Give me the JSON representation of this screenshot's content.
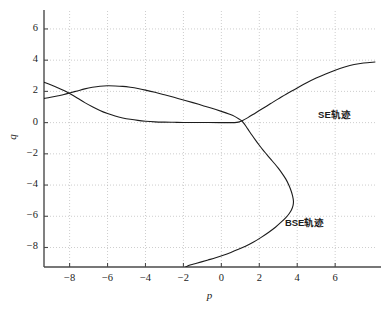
{
  "chart_data": {
    "type": "line",
    "title": "",
    "xlabel": "p",
    "ylabel": "q",
    "xlim": [
      -9.35,
      8.1
    ],
    "ylim": [
      -9.25,
      7.15
    ],
    "grid": true,
    "grid_style": "dotted",
    "legend_position": "inline-annotations",
    "xticks": [
      -8,
      -6,
      -4,
      -2,
      0,
      2,
      4,
      6
    ],
    "xtick_labels": [
      "−8",
      "−6",
      "−4",
      "−2",
      "0",
      "2",
      "4",
      "6"
    ],
    "yticks": [
      6,
      4,
      2,
      0,
      -2,
      -4,
      -6,
      -8
    ],
    "ytick_labels": [
      "6",
      "4",
      "2",
      "0",
      "−2",
      "−4",
      "−6",
      "−8"
    ],
    "series": [
      {
        "name": "SE轨迹",
        "label": "SE轨迹",
        "color": "#1c1c1c",
        "linewidth": 1.1,
        "points": [
          [
            -9.35,
            2.58
          ],
          [
            -9.0,
            2.42
          ],
          [
            -8.6,
            2.22
          ],
          [
            -8.3,
            2.05
          ],
          [
            -8.0,
            1.86
          ],
          [
            -7.6,
            1.58
          ],
          [
            -7.2,
            1.28
          ],
          [
            -6.8,
            1.02
          ],
          [
            -6.4,
            0.78
          ],
          [
            -6.0,
            0.58
          ],
          [
            -5.6,
            0.42
          ],
          [
            -5.2,
            0.3
          ],
          [
            -4.8,
            0.21
          ],
          [
            -4.4,
            0.14
          ],
          [
            -4.0,
            0.09
          ],
          [
            -3.5,
            0.05
          ],
          [
            -3.0,
            0.03
          ],
          [
            -2.5,
            0.02
          ],
          [
            -2.0,
            0.01
          ],
          [
            -1.0,
            0.005
          ],
          [
            0.0,
            0.0
          ],
          [
            0.4,
            0.0
          ],
          [
            0.7,
            0.0
          ],
          [
            0.9,
            0.03
          ],
          [
            1.1,
            0.12
          ],
          [
            1.4,
            0.32
          ],
          [
            1.8,
            0.62
          ],
          [
            2.2,
            0.92
          ],
          [
            2.6,
            1.22
          ],
          [
            3.0,
            1.52
          ],
          [
            3.5,
            1.88
          ],
          [
            4.0,
            2.22
          ],
          [
            4.5,
            2.55
          ],
          [
            5.0,
            2.85
          ],
          [
            5.5,
            3.12
          ],
          [
            6.0,
            3.36
          ],
          [
            6.5,
            3.56
          ],
          [
            7.0,
            3.72
          ],
          [
            7.5,
            3.82
          ],
          [
            8.1,
            3.88
          ]
        ]
      },
      {
        "name": "BSE轨迹",
        "label": "BSE轨迹",
        "color": "#1c1c1c",
        "linewidth": 1.1,
        "points": [
          [
            -9.35,
            1.55
          ],
          [
            -9.0,
            1.62
          ],
          [
            -8.6,
            1.72
          ],
          [
            -8.3,
            1.8
          ],
          [
            -8.0,
            1.9
          ],
          [
            -7.6,
            2.03
          ],
          [
            -7.2,
            2.16
          ],
          [
            -6.8,
            2.26
          ],
          [
            -6.4,
            2.33
          ],
          [
            -6.0,
            2.36
          ],
          [
            -5.6,
            2.35
          ],
          [
            -5.2,
            2.32
          ],
          [
            -4.8,
            2.26
          ],
          [
            -4.4,
            2.18
          ],
          [
            -4.0,
            2.08
          ],
          [
            -3.5,
            1.94
          ],
          [
            -3.0,
            1.78
          ],
          [
            -2.5,
            1.62
          ],
          [
            -2.0,
            1.45
          ],
          [
            -1.5,
            1.28
          ],
          [
            -1.0,
            1.1
          ],
          [
            -0.5,
            0.92
          ],
          [
            0.0,
            0.72
          ],
          [
            0.4,
            0.55
          ],
          [
            0.7,
            0.4
          ],
          [
            0.95,
            0.22
          ],
          [
            1.1,
            0.08
          ],
          [
            1.25,
            -0.15
          ],
          [
            1.4,
            -0.42
          ],
          [
            1.6,
            -0.78
          ],
          [
            1.8,
            -1.12
          ],
          [
            2.0,
            -1.45
          ],
          [
            2.2,
            -1.76
          ],
          [
            2.4,
            -2.05
          ],
          [
            2.6,
            -2.34
          ],
          [
            2.8,
            -2.62
          ],
          [
            3.0,
            -2.92
          ],
          [
            3.2,
            -3.25
          ],
          [
            3.4,
            -3.62
          ],
          [
            3.55,
            -3.98
          ],
          [
            3.68,
            -4.38
          ],
          [
            3.76,
            -4.72
          ],
          [
            3.8,
            -5.02
          ],
          [
            3.78,
            -5.3
          ],
          [
            3.7,
            -5.58
          ],
          [
            3.58,
            -5.82
          ],
          [
            3.4,
            -6.08
          ],
          [
            3.15,
            -6.38
          ],
          [
            2.85,
            -6.7
          ],
          [
            2.5,
            -7.02
          ],
          [
            2.1,
            -7.35
          ],
          [
            1.7,
            -7.65
          ],
          [
            1.3,
            -7.9
          ],
          [
            0.9,
            -8.12
          ],
          [
            0.5,
            -8.32
          ],
          [
            0.1,
            -8.5
          ],
          [
            -0.3,
            -8.66
          ],
          [
            -0.7,
            -8.8
          ],
          [
            -1.05,
            -8.92
          ],
          [
            -1.35,
            -9.02
          ],
          [
            -1.6,
            -9.1
          ],
          [
            -1.78,
            -9.18
          ],
          [
            -1.88,
            -9.25
          ]
        ]
      }
    ],
    "annotations": [
      {
        "text": "SE轨迹",
        "x": 5.1,
        "y": 0.55
      },
      {
        "text": "BSE轨迹",
        "x": 3.35,
        "y": -6.35
      }
    ]
  },
  "colors": {
    "background": "#ffffff",
    "axis": "#4a4a4a",
    "grid": "#b8b8b8",
    "curve": "#1c1c1c",
    "text": "#1c1c1c"
  }
}
